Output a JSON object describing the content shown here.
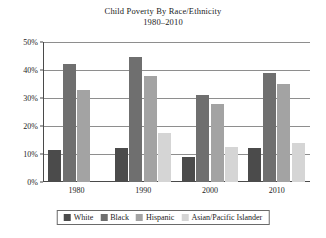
{
  "chart_data": {
    "type": "bar",
    "title": "Child Poverty By Race/Ethnicity",
    "subtitle": "1980–2010",
    "xlabel": "",
    "ylabel": "",
    "categories": [
      "1980",
      "1990",
      "2000",
      "2010"
    ],
    "ylim": [
      0,
      50
    ],
    "ytick_labels": [
      "0%",
      "10%",
      "20%",
      "30%",
      "40%",
      "50%"
    ],
    "ytick_values": [
      0,
      10,
      20,
      30,
      40,
      50
    ],
    "grid": true,
    "legend_position": "bottom",
    "series": [
      {
        "name": "White",
        "color": "#4b4b4b",
        "values": [
          11.5,
          12,
          9,
          12
        ]
      },
      {
        "name": "Black",
        "color": "#6f6f6f",
        "values": [
          42,
          44.5,
          31,
          39
        ]
      },
      {
        "name": "Hispanic",
        "color": "#a3a3a3",
        "values": [
          33,
          38,
          28,
          35
        ]
      },
      {
        "name": "Asian/Pacific Islander",
        "color": "#d5d5d5",
        "values": [
          null,
          17.5,
          12.5,
          14
        ]
      }
    ]
  }
}
